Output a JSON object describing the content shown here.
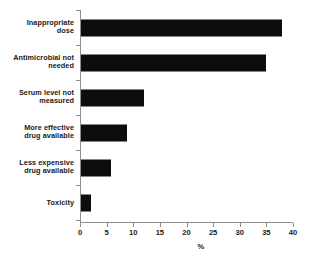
{
  "chart_data": {
    "type": "bar",
    "orientation": "horizontal",
    "title": "",
    "xlabel": "%",
    "ylabel": "",
    "categories": [
      "Inappropriate dose",
      "Antimicrobial not needed",
      "Serum level not measured",
      "More effective drug available",
      "Less expensive drug available",
      "Toxicity"
    ],
    "category_lines": [
      [
        "Inappropriate",
        "dose"
      ],
      [
        "Antimicrobial not",
        "needed"
      ],
      [
        "Serum level not",
        "measured"
      ],
      [
        "More effective",
        "drug available"
      ],
      [
        "Less expensive",
        "drug available"
      ],
      [
        "Toxicity"
      ]
    ],
    "values": [
      37.7,
      34.7,
      11.8,
      8.6,
      5.6,
      1.9
    ],
    "xlim": [
      0,
      40
    ],
    "xticks": [
      0,
      5,
      10,
      15,
      20,
      25,
      30,
      35,
      40
    ],
    "xtick_labels": [
      "0",
      "5",
      "10",
      "15",
      "20",
      "25",
      "30",
      "35",
      "40"
    ],
    "grid": false,
    "legend": null,
    "bar_color": "#0d0d0d",
    "axis_color": "#8e8e8e",
    "background_color": "#ffffff"
  }
}
